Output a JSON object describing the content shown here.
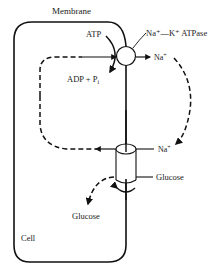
{
  "diagram": {
    "labels": {
      "membrane": "Membrane",
      "atp": "ATP",
      "adp": "ADP + P",
      "adp_sub": "i",
      "pump": "Na⁺—K⁺ ATPase",
      "na_top": "Na",
      "na_top_sup": "+",
      "na_bottom": "Na",
      "na_bottom_sup": "+",
      "glucose_out": "Glucose",
      "glucose_in": "Glucose",
      "cell": "Cell"
    },
    "colors": {
      "stroke": "#111111",
      "background": "#ffffff"
    },
    "components": [
      {
        "id": "cell-membrane",
        "type": "rounded-rect"
      },
      {
        "id": "na-k-atpase-pump",
        "type": "circle"
      },
      {
        "id": "na-glucose-symporter",
        "type": "cylinder"
      }
    ]
  }
}
